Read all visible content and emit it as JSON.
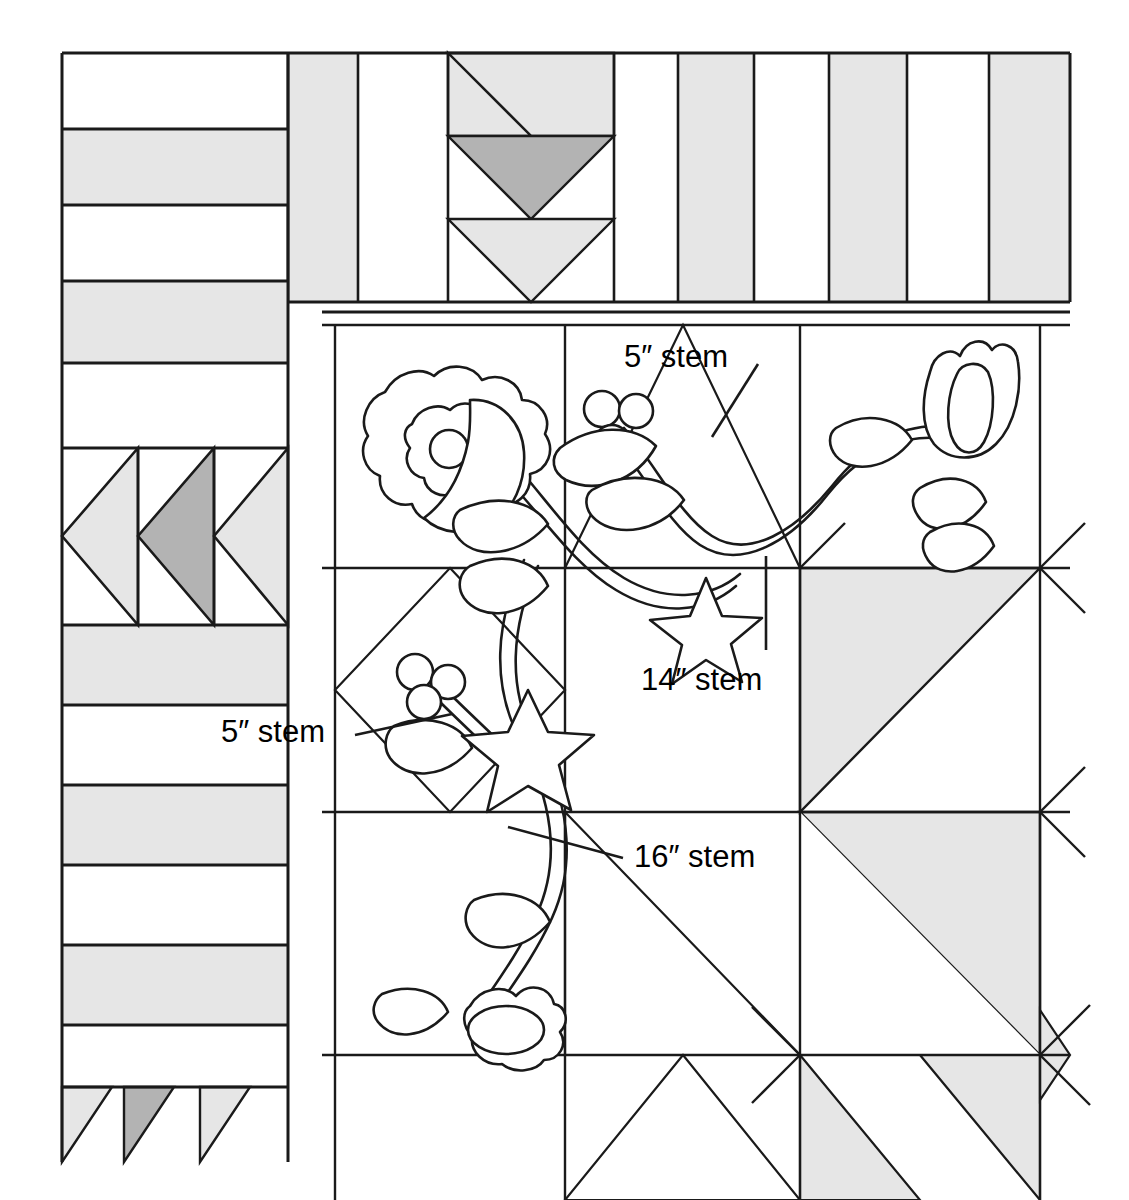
{
  "diagram": {
    "type": "quilt-block-layout",
    "colors": {
      "background": "#ffffff",
      "line": "#1a1a1a",
      "light_fabric": "#e6e6e6",
      "medium_fabric": "#b3b3b3",
      "white_fabric": "#ffffff"
    }
  },
  "annotations": [
    {
      "id": "stem-5-top",
      "text": "5″ stem",
      "length": 5,
      "unit": "inch",
      "x": 624,
      "y": 341,
      "leader": {
        "x1": 758,
        "y1": 364,
        "x2": 722,
        "y2": 423
      }
    },
    {
      "id": "stem-14",
      "text": "14″ stem",
      "length": 14,
      "unit": "inch",
      "x": 641,
      "y": 664,
      "leader": {
        "x1": 766,
        "y1": 556,
        "x2": 766,
        "y2": 650
      }
    },
    {
      "id": "stem-5-left",
      "text": "5″ stem",
      "length": 5,
      "unit": "inch",
      "x": 221,
      "y": 716,
      "leader": {
        "x1": 355,
        "y1": 735,
        "x2": 452,
        "y2": 714
      }
    },
    {
      "id": "stem-16",
      "text": "16″ stem",
      "length": 16,
      "unit": "inch",
      "x": 634,
      "y": 841,
      "leader": {
        "x1": 508,
        "y1": 827,
        "x2": 623,
        "y2": 858
      }
    }
  ],
  "top_border": {
    "name": "pieced-top-border",
    "bounds": {
      "x": 62,
      "y": 53,
      "w": 1008,
      "h": 249
    },
    "stripe_columns": [
      {
        "x": 62,
        "w": 226,
        "fill": "white"
      },
      {
        "x": 288,
        "w": 70,
        "fill": "light"
      },
      {
        "x": 358,
        "w": 90,
        "fill": "white"
      },
      {
        "x": 678,
        "w": 76,
        "fill": "light"
      },
      {
        "x": 754,
        "w": 75,
        "fill": "white"
      },
      {
        "x": 829,
        "w": 78,
        "fill": "light"
      },
      {
        "x": 907,
        "w": 82,
        "fill": "white"
      },
      {
        "x": 989,
        "w": 81,
        "fill": "light"
      }
    ],
    "chevron_block": {
      "x": 448,
      "y": 53,
      "w": 166,
      "h": 249,
      "chevrons": [
        {
          "fill": "light",
          "top": 53,
          "height": 83
        },
        {
          "fill": "medium",
          "top": 136,
          "height": 83
        },
        {
          "fill": "light",
          "top": 219,
          "height": 83
        }
      ]
    },
    "horizontal_rules": [
      53,
      136,
      219,
      302
    ]
  },
  "left_border": {
    "name": "pieced-left-border",
    "bounds": {
      "x": 62,
      "y": 53,
      "w": 226,
      "h": 1147
    },
    "stripe_rows": [
      {
        "y": 53,
        "h": 76,
        "fill": "white"
      },
      {
        "y": 129,
        "h": 76,
        "fill": "light"
      },
      {
        "y": 205,
        "h": 76,
        "fill": "white"
      },
      {
        "y": 281,
        "h": 82,
        "fill": "light"
      },
      {
        "y": 363,
        "h": 85,
        "fill": "white"
      },
      {
        "y": 625,
        "h": 80,
        "fill": "light"
      },
      {
        "y": 705,
        "h": 80,
        "fill": "white"
      },
      {
        "y": 785,
        "h": 80,
        "fill": "light"
      },
      {
        "y": 865,
        "h": 80,
        "fill": "white"
      },
      {
        "y": 945,
        "h": 80,
        "fill": "light"
      },
      {
        "y": 1025,
        "h": 62,
        "fill": "white"
      }
    ],
    "arrow_block": {
      "y": 448,
      "h": 177,
      "geese": [
        {
          "x": 62,
          "w": 76,
          "fill": "light"
        },
        {
          "x": 138,
          "w": 76,
          "fill": "medium"
        },
        {
          "x": 214,
          "w": 74,
          "fill": "light"
        }
      ]
    },
    "bottom_geese": {
      "y": 1087,
      "h": 75,
      "items": [
        {
          "x": 62,
          "w": 50,
          "fill": "light"
        },
        {
          "x": 124,
          "w": 50,
          "fill": "medium"
        },
        {
          "x": 200,
          "w": 50,
          "fill": "light"
        }
      ]
    }
  },
  "main_field": {
    "name": "appliqué-quilt-center",
    "bounds": {
      "x": 322,
      "y": 312,
      "w": 748,
      "h": 888
    },
    "grid_vertical_lines": [
      335,
      565,
      800,
      1040
    ],
    "grid_horizontal_lines": [
      325,
      568,
      812,
      1055
    ],
    "pieced_blocks": [
      {
        "id": "hst-top-center",
        "type": "half-square-triangle",
        "corner": "peak",
        "x": 565,
        "y": 325,
        "w": 235,
        "h": 243,
        "fill": "white"
      },
      {
        "id": "hst-mid-right",
        "type": "half-square-triangle",
        "corner": "top-left",
        "x": 800,
        "y": 568,
        "w": 240,
        "h": 244,
        "fill": "light"
      },
      {
        "id": "hst-low-right",
        "type": "half-square-triangle",
        "corner": "bottom-right",
        "x": 800,
        "y": 812,
        "w": 240,
        "h": 243,
        "fill": "light"
      },
      {
        "id": "hst-low-center",
        "type": "half-square-triangle",
        "corner": "bottom-right",
        "x": 565,
        "y": 812,
        "w": 235,
        "h": 243,
        "fill": "white"
      },
      {
        "id": "tri-bottom-1",
        "type": "quarter-triangle",
        "corner": "up",
        "x": 565,
        "y": 1055,
        "w": 235,
        "h": 145,
        "fill": "white"
      },
      {
        "id": "tri-bottom-2",
        "type": "quarter-triangle",
        "corner": "up",
        "x": 800,
        "y": 1055,
        "w": 240,
        "h": 145,
        "fill": "light"
      },
      {
        "id": "diamond-left",
        "type": "on-point-square",
        "corner": "diamond",
        "x": 335,
        "y": 568,
        "w": 230,
        "h": 244,
        "fill": "white"
      }
    ]
  },
  "applique_motifs": [
    {
      "id": "rose",
      "name": "scalloped-rose",
      "x": 430,
      "y": 440
    },
    {
      "id": "tulip-top",
      "name": "tulip-flower",
      "x": 975,
      "y": 400
    },
    {
      "id": "tulip-bottom",
      "name": "tulip-bud",
      "x": 500,
      "y": 1015
    },
    {
      "id": "berries-upper",
      "name": "berry-cluster",
      "x": 615,
      "y": 420,
      "count": 3
    },
    {
      "id": "berries-lower",
      "name": "berry-cluster",
      "x": 430,
      "y": 685,
      "count": 3
    },
    {
      "id": "star-upper",
      "name": "five-point-star",
      "x": 705,
      "y": 620
    },
    {
      "id": "star-lower",
      "name": "five-point-star",
      "x": 525,
      "y": 730
    },
    {
      "id": "leaves",
      "name": "leaf-set",
      "count": 8
    },
    {
      "id": "vine",
      "name": "curving-stem-vine"
    }
  ]
}
